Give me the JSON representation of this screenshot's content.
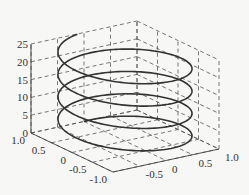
{
  "chart_data": {
    "type": "line3d",
    "title": "",
    "series": [
      {
        "name": "helix",
        "t_range": [
          0,
          25
        ],
        "x": "sin(t)",
        "y": "cos(t)",
        "z": "t",
        "turns": 3.98,
        "color": "#333333"
      }
    ],
    "xlabel": "",
    "ylabel": "",
    "zlabel": "",
    "xlim": [
      -1.0,
      1.0
    ],
    "ylim": [
      -1.0,
      1.0
    ],
    "zlim": [
      0,
      25
    ],
    "x_ticks": [
      "-1.0",
      "-0.5",
      "0",
      "0.5",
      "1.0"
    ],
    "y_ticks": [
      "1.0",
      "0.5",
      "0",
      "-0.5",
      "-1.0"
    ],
    "z_ticks": [
      "0",
      "5",
      "10",
      "15",
      "20",
      "25"
    ],
    "grid": true,
    "grid_style": "dashed",
    "legend": "none"
  },
  "labels": {
    "z": [
      "0",
      "5",
      "10",
      "15",
      "20",
      "25"
    ],
    "left_axis": [
      "1.0",
      "0.5",
      "0",
      "-0.5",
      "-1.0"
    ],
    "right_axis": [
      "-0.5",
      "0",
      "0.5",
      "1.0"
    ]
  }
}
